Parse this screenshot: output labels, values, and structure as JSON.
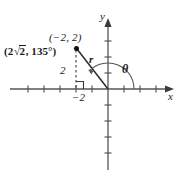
{
  "figure": {
    "background_color": "#ffffff",
    "stroke_color": "#4d4d4d",
    "text_color": "#1a1a1a",
    "width": 182,
    "height": 180
  },
  "axes": {
    "x_label": "x",
    "y_label": "y",
    "origin_px": [
      108,
      89
    ],
    "unit_px": 16,
    "x_range_px": [
      10,
      172
    ],
    "y_range_px": [
      18,
      172
    ],
    "x_tick_count": 8,
    "y_tick_count": 8,
    "arrowheads": [
      "x-positive",
      "y-positive"
    ]
  },
  "point": {
    "rectangular_label": "(−2, 2)",
    "polar_label_prefix": "(2",
    "polar_label_radical": "2",
    "polar_label_suffix": ", 135°)",
    "x_value": -2,
    "y_value": 2,
    "r_value": "2√2",
    "theta_value": "135°",
    "marker_px": [
      76,
      48
    ]
  },
  "annotations": {
    "r_label": "r",
    "theta_label": "θ",
    "height_label": "2",
    "x_intercept_label": "−2",
    "right_angle_marker": true,
    "dashed_drop_line": true,
    "radius_segment": true,
    "angle_arc": true
  }
}
